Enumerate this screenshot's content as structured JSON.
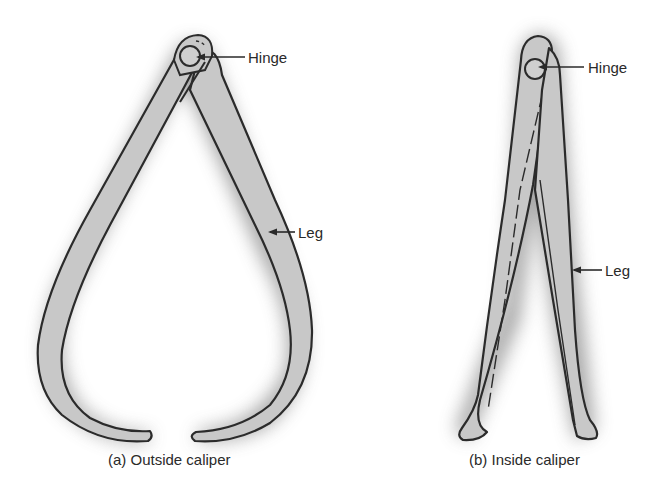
{
  "figure": {
    "panels": [
      {
        "id": "a",
        "caption": "(a) Outside caliper",
        "labels": {
          "hinge": "Hinge",
          "leg": "Leg"
        }
      },
      {
        "id": "b",
        "caption": "(b) Inside caliper",
        "labels": {
          "hinge": "Hinge",
          "leg": "Leg"
        }
      }
    ],
    "colors": {
      "leg_fill": "#c8c8c8",
      "outline": "#2b2b2b",
      "shadow": "#9a9a9a",
      "text": "#2a2a2a",
      "background": "#ffffff"
    }
  }
}
